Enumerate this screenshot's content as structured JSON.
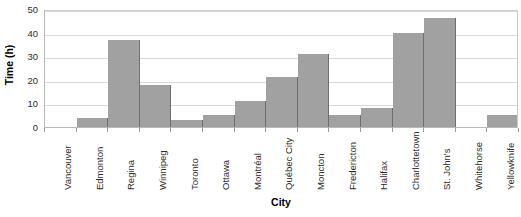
{
  "chart_data": {
    "type": "bar",
    "title": "",
    "xlabel": "City",
    "ylabel": "Time (h)",
    "categories": [
      "Vancouver",
      "Edmonton",
      "Regina",
      "Winnipeg",
      "Toronto",
      "Ottawa",
      "Montréal",
      "Québec City",
      "Moncton",
      "Fredericton",
      "Halifax",
      "Charlottetown",
      "St. John's",
      "Whitehorse",
      "Yellowknife"
    ],
    "values": [
      0,
      4,
      37,
      18,
      3,
      5,
      11,
      21,
      31,
      5,
      8,
      40,
      46,
      0,
      5
    ],
    "ylim": [
      0,
      50
    ],
    "yticks": [
      0,
      10,
      20,
      30,
      40,
      50
    ],
    "ytick_labels": [
      "0",
      "10",
      "20",
      "30",
      "40",
      "50"
    ],
    "grid": true,
    "grid_axis": "y",
    "legend": null,
    "bar_color": "#a1a1a1",
    "bar_edge_color": "#6e6e6e",
    "grid_color": "#d9d9d9",
    "axis_color": "#b8b8b8",
    "text_color": "#2b2b2b",
    "background_color": "#ffffff",
    "bar_gap": 0
  }
}
